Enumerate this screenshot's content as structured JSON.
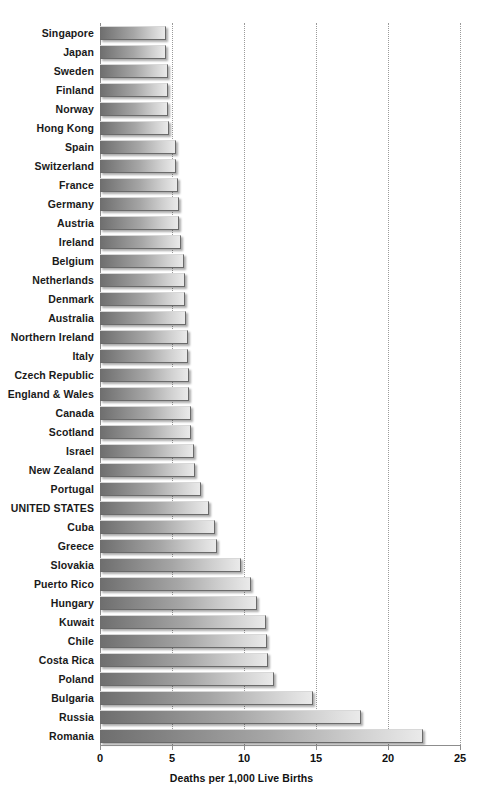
{
  "chart_data": {
    "type": "bar",
    "orientation": "horizontal",
    "title": "",
    "subtitle": "",
    "xlabel": "Deaths per 1,000 Live Births",
    "ylabel": "",
    "xlim": [
      0,
      25
    ],
    "xticks": [
      0,
      5,
      10,
      15,
      20,
      25
    ],
    "xtick_labels": [
      "0",
      "5",
      "10",
      "15",
      "20",
      "25"
    ],
    "grid": "vertical-dotted",
    "legend": "none",
    "highlight_category": "UNITED STATES",
    "categories": [
      "Singapore",
      "Japan",
      "Sweden",
      "Finland",
      "Norway",
      "Hong Kong",
      "Spain",
      "Switzerland",
      "France",
      "Germany",
      "Austria",
      "Ireland",
      "Belgium",
      "Netherlands",
      "Denmark",
      "Australia",
      "Northern Ireland",
      "Italy",
      "Czech Republic",
      "England & Wales",
      "Canada",
      "Scotland",
      "Israel",
      "New Zealand",
      "Portugal",
      "UNITED STATES",
      "Cuba",
      "Greece",
      "Slovakia",
      "Puerto Rico",
      "Hungary",
      "Kuwait",
      "Chile",
      "Costa Rica",
      "Poland",
      "Bulgaria",
      "Russia",
      "Romania"
    ],
    "values": [
      4.6,
      4.6,
      4.7,
      4.7,
      4.7,
      4.8,
      5.3,
      5.3,
      5.4,
      5.5,
      5.5,
      5.6,
      5.8,
      5.9,
      5.9,
      6.0,
      6.1,
      6.1,
      6.2,
      6.2,
      6.3,
      6.3,
      6.5,
      6.6,
      7.0,
      7.6,
      8.0,
      8.1,
      9.8,
      10.5,
      10.9,
      11.5,
      11.6,
      11.7,
      12.1,
      14.8,
      18.1,
      22.4
    ],
    "value_unit": "deaths per 1,000 live births"
  },
  "axis": {
    "title": "Deaths per 1,000 Live Births"
  }
}
